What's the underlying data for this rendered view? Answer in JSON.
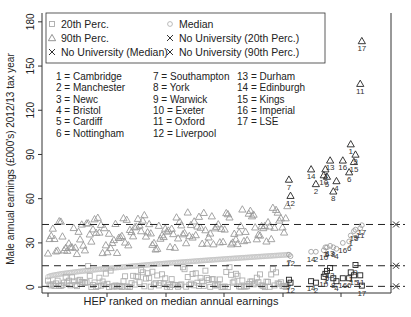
{
  "chart_data": {
    "type": "scatter",
    "title": "",
    "xlabel": "HEP ranked on median annual earnings",
    "ylabel": "Male annual earnings (£000's) 2012/13 tax year",
    "ylim": [
      0,
      180
    ],
    "yticks": [
      0,
      30,
      60,
      90,
      120,
      150,
      180
    ],
    "grid": false,
    "legend_position": "top-left (inside)",
    "legend": [
      {
        "marker": "square",
        "color": "#aaaaaa",
        "label": "20th Perc."
      },
      {
        "marker": "circle",
        "color": "#aaaaaa",
        "label": "Median"
      },
      {
        "marker": "triangle",
        "color": "#888888",
        "label": "90th Perc."
      },
      {
        "marker": "x",
        "color": "#333333",
        "label": "No University (20th Perc.)"
      },
      {
        "marker": "x",
        "color": "#333333",
        "label": "No University (Median)"
      },
      {
        "marker": "x",
        "color": "#333333",
        "label": "No University (90th Perc.)"
      }
    ],
    "reference_lines": [
      {
        "name": "No University (20th Perc.)",
        "y": 0.5,
        "style": "dashed"
      },
      {
        "name": "No University (Median)",
        "y": 14.5,
        "style": "dashed"
      },
      {
        "name": "No University (90th Perc.)",
        "y": 42.5,
        "style": "dashed"
      }
    ],
    "key": [
      "1 = Cambridge",
      "2 = Manchester",
      "3 = Newc",
      "4 = Bristol",
      "5 = Cardiff",
      "6 = Nottingham",
      "7 = Southampton",
      "8 = York",
      "9 = Warwick",
      "10 = Exeter",
      "11 = Oxford",
      "12 = Liverpool",
      "13 = Durham",
      "14 = Edinburgh",
      "15 = Kings",
      "16 = Imperial",
      "17 = LSE"
    ],
    "labelled_points": [
      {
        "id": 7,
        "rank_pct": 0.76,
        "p20": 5,
        "median": 22,
        "p90": 73
      },
      {
        "id": 12,
        "rank_pct": 0.765,
        "p20": 3,
        "median": 21,
        "p90": 62
      },
      {
        "id": 14,
        "rank_pct": 0.83,
        "p20": 4,
        "median": 24,
        "p90": 80
      },
      {
        "id": 2,
        "rank_pct": 0.845,
        "p20": 3,
        "median": 24,
        "p90": 70
      },
      {
        "id": 10,
        "rank_pct": 0.87,
        "p20": 7,
        "median": 25,
        "p90": 76
      },
      {
        "id": 3,
        "rank_pct": 0.875,
        "p20": 9,
        "median": 27,
        "p90": 80
      },
      {
        "id": 5,
        "rank_pct": 0.88,
        "p20": 11,
        "median": 27,
        "p90": 75
      },
      {
        "id": 13,
        "rank_pct": 0.89,
        "p20": 13,
        "median": 28,
        "p90": 86
      },
      {
        "id": 8,
        "rank_pct": 0.9,
        "p20": 6,
        "median": 27,
        "p90": 65
      },
      {
        "id": 4,
        "rank_pct": 0.91,
        "p20": 4,
        "median": 26,
        "p90": 72
      },
      {
        "id": 16,
        "rank_pct": 0.93,
        "p20": 6,
        "median": 30,
        "p90": 86
      },
      {
        "id": 6,
        "rank_pct": 0.95,
        "p20": 6,
        "median": 31,
        "p90": 78
      },
      {
        "id": 1,
        "rank_pct": 0.955,
        "p20": 10,
        "median": 35,
        "p90": 97
      },
      {
        "id": 15,
        "rank_pct": 0.965,
        "p20": 8,
        "median": 38,
        "p90": 85
      },
      {
        "id": 9,
        "rank_pct": 0.97,
        "p20": 15,
        "median": 39,
        "p90": 90
      },
      {
        "id": 11,
        "rank_pct": 0.985,
        "p20": 8,
        "median": 40,
        "p90": 138
      },
      {
        "id": 17,
        "rank_pct": 0.99,
        "p20": 1,
        "median": 42,
        "p90": 167
      }
    ],
    "series_summary": [
      {
        "name": "20th Perc.",
        "range": [
          0,
          15
        ],
        "note": "mostly 0-8, scattered"
      },
      {
        "name": "Median",
        "range": [
          7,
          42
        ],
        "note": "monotonically increasing (ranking variable)"
      },
      {
        "name": "90th Perc.",
        "range": [
          20,
          167
        ],
        "note": "20-50 for most HEPs, rising sharply for top ranks"
      }
    ]
  }
}
